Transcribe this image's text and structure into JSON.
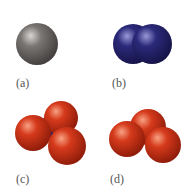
{
  "figure": {
    "panels": [
      {
        "id": "a",
        "label": "(a)",
        "label_pos": [
          16,
          77
        ],
        "description": "single gray atom",
        "spheres": [
          {
            "cx": 37,
            "cy": 44,
            "r": 21,
            "color": "gray"
          }
        ]
      },
      {
        "id": "b",
        "label": "(b)",
        "label_pos": [
          112,
          77
        ],
        "description": "diatomic blue molecule",
        "spheres": [
          {
            "cx": 133,
            "cy": 44,
            "r": 20,
            "color": "blue"
          },
          {
            "cx": 152,
            "cy": 44,
            "r": 20,
            "color": "blue"
          }
        ]
      },
      {
        "id": "c",
        "label": "(c)",
        "label_pos": [
          16,
          173
        ],
        "description": "blue central atom with three red atoms",
        "spheres": [
          {
            "cx": 52,
            "cy": 128,
            "r": 13,
            "color": "blue"
          },
          {
            "cx": 61,
            "cy": 118,
            "r": 17,
            "color": "red"
          },
          {
            "cx": 33,
            "cy": 133,
            "r": 18,
            "color": "red"
          },
          {
            "cx": 67,
            "cy": 146,
            "r": 19,
            "color": "red"
          }
        ]
      },
      {
        "id": "d",
        "label": "(d)",
        "label_pos": [
          110,
          173
        ],
        "description": "three red atoms bent",
        "spheres": [
          {
            "cx": 148,
            "cy": 127,
            "r": 18,
            "color": "red"
          },
          {
            "cx": 127,
            "cy": 139,
            "r": 18,
            "color": "red"
          },
          {
            "cx": 163,
            "cy": 145,
            "r": 18,
            "color": "red"
          }
        ]
      }
    ],
    "colors": {
      "gray": {
        "light": "#d8d6d4",
        "mid": "#7a7674",
        "dark": "#3e3b3a"
      },
      "blue": {
        "light": "#9a98d8",
        "mid": "#2b2a7a",
        "dark": "#141245"
      },
      "red": {
        "light": "#f7a283",
        "mid": "#d63a1c",
        "dark": "#8a1a08"
      }
    }
  }
}
